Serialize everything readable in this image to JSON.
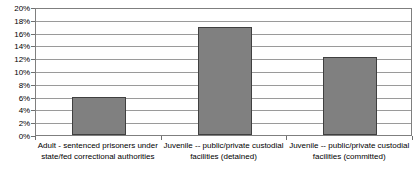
{
  "chart_data": {
    "type": "bar",
    "title": "",
    "subtitle": "",
    "xlabel": "",
    "ylabel": "",
    "categories": [
      "Adult - sentenced prisoners under state/fed correctional authorities",
      "Juvenile -- public/private custodial facilities (detained)",
      "Juvenile -- public/private custodial facilities (committed)"
    ],
    "values": [
      6.0,
      16.8,
      12.2
    ],
    "value_labels": [
      "6%",
      "16.8%",
      "12.2%"
    ],
    "ylim": [
      0,
      20
    ],
    "ytick_step": 2,
    "ytick_labels": [
      "0%",
      "2%",
      "4%",
      "6%",
      "8%",
      "10%",
      "12%",
      "14%",
      "16%",
      "18%",
      "20%"
    ],
    "ytick_values": [
      0,
      2,
      4,
      6,
      8,
      10,
      12,
      14,
      16,
      18,
      20
    ],
    "grid": true,
    "legend": false,
    "legend_position": "none",
    "bar_color": "#808080",
    "bar_border_color": "#404040",
    "gridline_color": "#9a9a9a",
    "plot_border_color": "#7f7f7f",
    "background_color": "#ffffff"
  }
}
